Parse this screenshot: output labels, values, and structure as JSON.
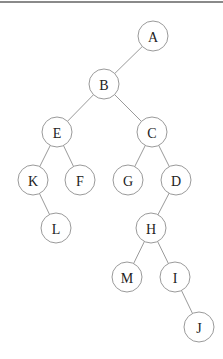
{
  "diagram": {
    "type": "binary-tree",
    "nodes": [
      {
        "id": "A",
        "label": "A"
      },
      {
        "id": "B",
        "label": "B"
      },
      {
        "id": "E",
        "label": "E"
      },
      {
        "id": "C",
        "label": "C"
      },
      {
        "id": "K",
        "label": "K"
      },
      {
        "id": "F",
        "label": "F"
      },
      {
        "id": "G",
        "label": "G"
      },
      {
        "id": "D",
        "label": "D"
      },
      {
        "id": "L",
        "label": "L"
      },
      {
        "id": "H",
        "label": "H"
      },
      {
        "id": "M",
        "label": "M"
      },
      {
        "id": "I",
        "label": "I"
      },
      {
        "id": "J",
        "label": "J"
      }
    ],
    "edges": [
      {
        "from": "A",
        "to": "B",
        "side": "left"
      },
      {
        "from": "B",
        "to": "E",
        "side": "left"
      },
      {
        "from": "B",
        "to": "C",
        "side": "right"
      },
      {
        "from": "E",
        "to": "K",
        "side": "left"
      },
      {
        "from": "E",
        "to": "F",
        "side": "right"
      },
      {
        "from": "C",
        "to": "G",
        "side": "left"
      },
      {
        "from": "C",
        "to": "D",
        "side": "right"
      },
      {
        "from": "K",
        "to": "L",
        "side": "right"
      },
      {
        "from": "D",
        "to": "H",
        "side": "left"
      },
      {
        "from": "H",
        "to": "M",
        "side": "left"
      },
      {
        "from": "H",
        "to": "I",
        "side": "right"
      },
      {
        "from": "I",
        "to": "J",
        "side": "right"
      }
    ]
  }
}
